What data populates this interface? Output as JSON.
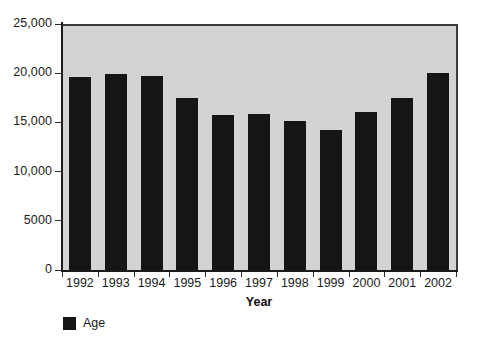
{
  "chart_data": {
    "type": "bar",
    "title": "",
    "xlabel": "Year",
    "ylabel": "",
    "categories": [
      "1992",
      "1993",
      "1994",
      "1995",
      "1996",
      "1997",
      "1998",
      "1999",
      "2000",
      "2001",
      "2002"
    ],
    "values": [
      19600,
      19900,
      19700,
      17500,
      15800,
      15850,
      15150,
      14200,
      16100,
      17500,
      20050
    ],
    "series": [
      {
        "name": "Age",
        "values": [
          19600,
          19900,
          19700,
          17500,
          15800,
          15850,
          15150,
          14200,
          16100,
          17500,
          20050
        ],
        "color": "#151515"
      }
    ],
    "ylim": [
      0,
      25000
    ],
    "y_ticks": [
      0,
      5000,
      10000,
      15000,
      20000,
      25000
    ],
    "y_tick_labels": [
      "0",
      "5000",
      "10,000",
      "15,000",
      "20,000",
      "25,000"
    ],
    "grid": false,
    "legend_position": "bottom-left",
    "plot_background": "#d3d3d3",
    "axis_color": "#1a1a1a"
  },
  "legend": {
    "entries": [
      {
        "label": "Age",
        "color": "#151515"
      }
    ]
  },
  "axis": {
    "x_title": "Year"
  }
}
